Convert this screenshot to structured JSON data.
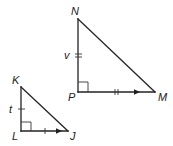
{
  "diagram": {
    "type": "geometry-similar-right-triangles",
    "triangles": [
      {
        "name": "triangle-NPM",
        "vertices": {
          "N": {
            "label": "N",
            "x": 78,
            "y": 19
          },
          "P": {
            "label": "P",
            "x": 78,
            "y": 92
          },
          "M": {
            "label": "M",
            "x": 155,
            "y": 92
          }
        },
        "right_angle_at": "P",
        "side_labels": {
          "NP": "v"
        },
        "tick_marks": {
          "NP": 2,
          "PM": 2
        },
        "arrow_on": "PM"
      },
      {
        "name": "triangle-KLJ",
        "vertices": {
          "K": {
            "label": "K",
            "x": 21,
            "y": 87
          },
          "L": {
            "label": "L",
            "x": 21,
            "y": 131
          },
          "J": {
            "label": "J",
            "x": 68,
            "y": 131
          }
        },
        "right_angle_at": "L",
        "side_labels": {
          "KL": "t"
        },
        "tick_marks": {
          "KL": 1,
          "LJ": 1
        },
        "arrow_on": "LJ"
      }
    ],
    "labels": {
      "N": "N",
      "P": "P",
      "M": "M",
      "v": "v",
      "K": "K",
      "L": "L",
      "J": "J",
      "t": "t"
    },
    "colors": {
      "stroke": "#222222",
      "background": "#ffffff"
    }
  }
}
